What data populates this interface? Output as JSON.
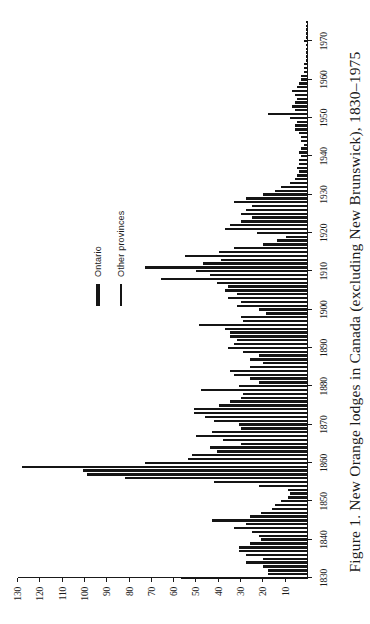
{
  "figure": {
    "caption": "Figure 1. New Orange lodges in Canada (excluding New Brunswick), 1830–1975"
  },
  "legend": {
    "position": "inside-top-right",
    "items": [
      {
        "label": "Ontario",
        "key": "ontario",
        "style": "thick-bar"
      },
      {
        "label": "Other provinces",
        "key": "other_provinces",
        "style": "thin-bar"
      }
    ]
  },
  "chart_data": {
    "type": "bar",
    "title": "Figure 1. New Orange lodges in Canada (excluding New Brunswick), 1830–1975",
    "xlabel": "",
    "ylabel": "",
    "xlim": [
      1830,
      1975
    ],
    "ylim": [
      0,
      130
    ],
    "grid": false,
    "orientation": "vertical-bars-rendered-rotated",
    "y_ticks": [
      130,
      120,
      110,
      100,
      90,
      80,
      70,
      60,
      50,
      40,
      30,
      20,
      10
    ],
    "x_ticks": [
      1830,
      1840,
      1850,
      1860,
      1870,
      1880,
      1890,
      1900,
      1910,
      1920,
      1930,
      1940,
      1950,
      1960,
      1970
    ],
    "x_tick_labels": [
      "1830",
      "1840",
      "1850",
      "1860",
      "1870",
      "1880",
      "1890",
      "1900",
      "1910",
      "1920",
      "1930",
      "1940",
      "1950",
      "1960",
      "1970"
    ],
    "y_tick_labels": [
      "130",
      "120",
      "110",
      "100",
      "90",
      "80",
      "70",
      "60",
      "50",
      "40",
      "30",
      "20",
      "10"
    ],
    "x": [
      1830,
      1831,
      1832,
      1833,
      1834,
      1835,
      1836,
      1837,
      1838,
      1839,
      1840,
      1841,
      1842,
      1843,
      1844,
      1845,
      1846,
      1847,
      1848,
      1849,
      1850,
      1851,
      1852,
      1853,
      1854,
      1855,
      1856,
      1857,
      1858,
      1859,
      1860,
      1861,
      1862,
      1863,
      1864,
      1865,
      1866,
      1867,
      1868,
      1869,
      1870,
      1871,
      1872,
      1873,
      1874,
      1875,
      1876,
      1877,
      1878,
      1879,
      1880,
      1881,
      1882,
      1883,
      1884,
      1885,
      1886,
      1887,
      1888,
      1889,
      1890,
      1891,
      1892,
      1893,
      1894,
      1895,
      1896,
      1897,
      1898,
      1899,
      1900,
      1901,
      1902,
      1903,
      1904,
      1905,
      1906,
      1907,
      1908,
      1909,
      1910,
      1911,
      1912,
      1913,
      1914,
      1915,
      1916,
      1917,
      1918,
      1919,
      1920,
      1921,
      1922,
      1923,
      1924,
      1925,
      1926,
      1927,
      1928,
      1929,
      1930,
      1931,
      1932,
      1933,
      1934,
      1935,
      1936,
      1937,
      1938,
      1939,
      1940,
      1941,
      1942,
      1943,
      1944,
      1945,
      1946,
      1947,
      1948,
      1949,
      1950,
      1951,
      1952,
      1953,
      1954,
      1955,
      1956,
      1957,
      1958,
      1959,
      1960,
      1961,
      1962,
      1963,
      1964,
      1965,
      1966,
      1967,
      1968,
      1969,
      1970,
      1971,
      1972,
      1973,
      1974,
      1975
    ],
    "series": [
      {
        "name": "Ontario",
        "values": [
          57,
          18,
          18,
          20,
          28,
          20,
          28,
          31,
          31,
          26,
          21,
          22,
          25,
          33,
          28,
          43,
          26,
          21,
          16,
          15,
          12,
          9,
          8,
          9,
          22,
          42,
          82,
          99,
          101,
          128,
          73,
          54,
          52,
          41,
          44,
          30,
          38,
          50,
          43,
          30,
          31,
          42,
          46,
          51,
          51,
          40,
          35,
          30,
          29,
          48,
          31,
          22,
          26,
          33,
          35,
          26,
          20,
          26,
          22,
          29,
          36,
          33,
          32,
          35,
          35,
          37,
          49,
          29,
          30,
          19,
          22,
          32,
          30,
          36,
          32,
          37,
          36,
          41,
          66,
          44,
          50,
          73,
          47,
          39,
          55,
          40,
          33,
          20,
          14,
          10,
          23,
          37,
          35,
          30,
          25,
          30,
          28,
          25,
          33,
          28,
          20,
          15,
          12,
          8,
          6,
          5,
          4,
          5,
          4,
          4,
          3,
          4,
          3,
          2,
          3,
          3,
          4,
          6,
          6,
          5,
          8,
          18,
          6,
          7,
          6,
          5,
          6,
          7,
          5,
          4,
          3,
          3,
          2,
          2,
          2,
          1,
          1,
          1,
          1,
          1,
          2,
          1,
          1,
          1,
          1,
          1
        ]
      },
      {
        "name": "Other provinces",
        "values": [
          0,
          0,
          0,
          0,
          0,
          0,
          0,
          0,
          0,
          0,
          0,
          0,
          0,
          0,
          0,
          0,
          0,
          0,
          0,
          0,
          0,
          0,
          0,
          0,
          0,
          0,
          0,
          0,
          0,
          0,
          0,
          0,
          0,
          0,
          0,
          0,
          0,
          0,
          0,
          0,
          0,
          0,
          0,
          0,
          0,
          0,
          0,
          0,
          0,
          0,
          0,
          0,
          0,
          0,
          0,
          0,
          0,
          0,
          0,
          0,
          0,
          0,
          0,
          0,
          0,
          0,
          0,
          0,
          0,
          0,
          0,
          0,
          0,
          0,
          0,
          0,
          0,
          0,
          0,
          0,
          0,
          0,
          0,
          0,
          0,
          0,
          0,
          0,
          0,
          0,
          0,
          0,
          0,
          0,
          0,
          0,
          0,
          0,
          0,
          0,
          0,
          0,
          0,
          0,
          0,
          0,
          0,
          0,
          0,
          0,
          0,
          0,
          0,
          0,
          0,
          0,
          0,
          0,
          0,
          0,
          0,
          0,
          0,
          0,
          0,
          0,
          0,
          0,
          0,
          0,
          0,
          0,
          0,
          0,
          0,
          0,
          0,
          0,
          0,
          0,
          0,
          0,
          0,
          0,
          0,
          0
        ]
      }
    ],
    "values": [
      57,
      18,
      18,
      20,
      28,
      20,
      28,
      31,
      31,
      26,
      21,
      22,
      25,
      33,
      28,
      43,
      26,
      21,
      16,
      15,
      12,
      9,
      8,
      9,
      22,
      42,
      82,
      99,
      101,
      128,
      73,
      54,
      52,
      41,
      44,
      30,
      38,
      50,
      43,
      30,
      31,
      42,
      46,
      51,
      51,
      40,
      35,
      30,
      29,
      48,
      31,
      22,
      26,
      33,
      35,
      26,
      20,
      26,
      22,
      29,
      36,
      33,
      32,
      35,
      35,
      37,
      49,
      29,
      30,
      19,
      22,
      32,
      30,
      36,
      32,
      37,
      36,
      41,
      66,
      44,
      50,
      73,
      47,
      39,
      55,
      40,
      33,
      20,
      14,
      10,
      23,
      37,
      35,
      30,
      25,
      30,
      28,
      25,
      33,
      28,
      20,
      15,
      12,
      8,
      6,
      5,
      4,
      5,
      4,
      4,
      3,
      4,
      3,
      2,
      3,
      3,
      4,
      6,
      6,
      5,
      8,
      18,
      6,
      7,
      6,
      5,
      6,
      7,
      5,
      4,
      3,
      3,
      2,
      2,
      2,
      1,
      1,
      1,
      1,
      1,
      2,
      1,
      1,
      1,
      1,
      1
    ]
  },
  "colors": {
    "bar": "#151515",
    "axis": "#1a1a1a",
    "background": "#ffffff",
    "text": "#1a1a1a"
  }
}
